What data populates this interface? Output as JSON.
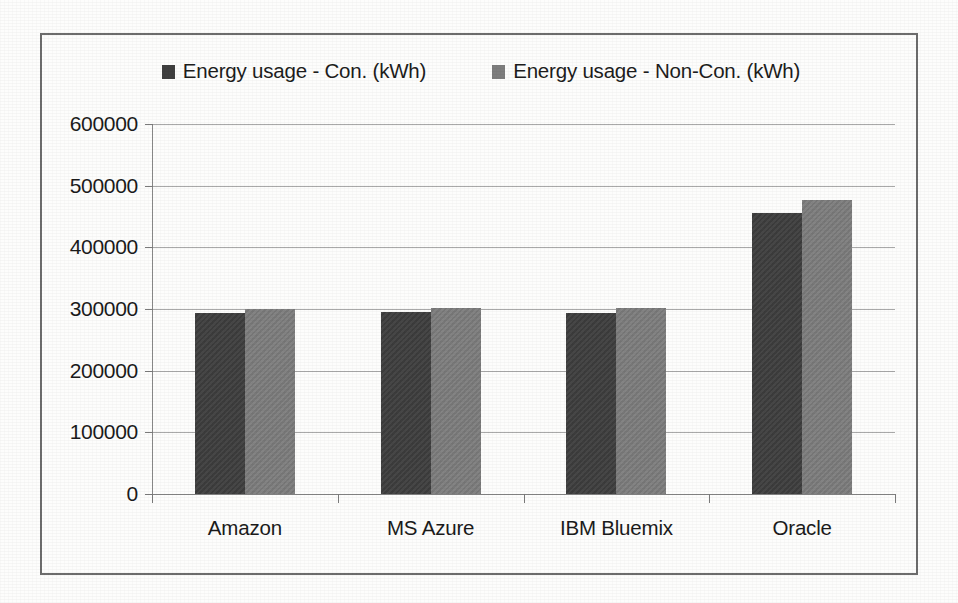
{
  "chart_data": {
    "type": "bar",
    "title": "",
    "xlabel": "",
    "ylabel": "",
    "categories": [
      "Amazon",
      "MS Azure",
      "IBM Bluemix",
      "Oracle"
    ],
    "series": [
      {
        "name": "Energy usage - Con. (kWh)",
        "color": "#3f3f3f",
        "values": [
          293000,
          295000,
          293000,
          455000
        ]
      },
      {
        "name": "Energy usage - Non-Con. (kWh)",
        "color": "#7e7e7e",
        "values": [
          300000,
          302000,
          301000,
          477000
        ]
      }
    ],
    "ylim": [
      0,
      600000
    ],
    "ytick_values": [
      600000,
      500000,
      400000,
      300000,
      200000,
      100000,
      0
    ],
    "ytick_labels": [
      "600000",
      "500000",
      "400000",
      "300000",
      "200000",
      "100000",
      "0"
    ],
    "grid": true,
    "legend_position": "top"
  },
  "legend": {
    "items": [
      {
        "label": "Energy usage - Con. (kWh)",
        "swatch": "dark"
      },
      {
        "label": "Energy usage - Non-Con. (kWh)",
        "swatch": "gray"
      }
    ]
  }
}
